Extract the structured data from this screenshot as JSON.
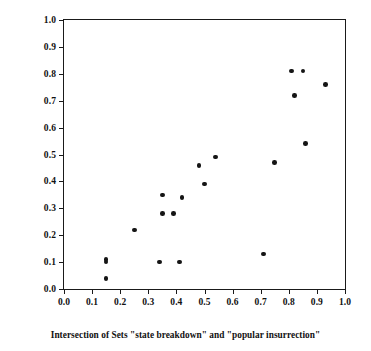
{
  "chart_data": {
    "type": "scatter",
    "title": "",
    "xlabel": "Intersection of Sets \"state breakdown\" and \"popular insurrection\"",
    "ylabel": "Membership in Set of \"social revolutions\"",
    "xlim": [
      0.0,
      1.0
    ],
    "ylim": [
      0.0,
      1.0
    ],
    "grid": false,
    "legend": null,
    "xticks": [
      "0.0",
      "0.1",
      "0.2",
      "0.3",
      "0.4",
      "0.5",
      "0.6",
      "0.7",
      "0.8",
      "0.9",
      "1.0"
    ],
    "xtick_values": [
      0.0,
      0.1,
      0.2,
      0.3,
      0.4,
      0.5,
      0.6,
      0.7,
      0.8,
      0.9,
      1.0
    ],
    "yticks": [
      "0.0",
      "0.1",
      "0.2",
      "0.3",
      "0.4",
      "0.5",
      "0.6",
      "0.7",
      "0.8",
      "0.9",
      "1.0"
    ],
    "ytick_values": [
      0.0,
      0.1,
      0.2,
      0.3,
      0.4,
      0.5,
      0.6,
      0.7,
      0.8,
      0.9,
      1.0
    ],
    "marker": "filled-circle",
    "marker_color": "#151515",
    "marker_size": 4.6,
    "points": [
      {
        "x": 0.15,
        "y": 0.11
      },
      {
        "x": 0.15,
        "y": 0.1
      },
      {
        "x": 0.15,
        "y": 0.04
      },
      {
        "x": 0.25,
        "y": 0.22
      },
      {
        "x": 0.34,
        "y": 0.1
      },
      {
        "x": 0.35,
        "y": 0.35
      },
      {
        "x": 0.35,
        "y": 0.28
      },
      {
        "x": 0.39,
        "y": 0.28
      },
      {
        "x": 0.41,
        "y": 0.1
      },
      {
        "x": 0.42,
        "y": 0.34
      },
      {
        "x": 0.48,
        "y": 0.46
      },
      {
        "x": 0.5,
        "y": 0.39
      },
      {
        "x": 0.54,
        "y": 0.49
      },
      {
        "x": 0.71,
        "y": 0.13
      },
      {
        "x": 0.75,
        "y": 0.47
      },
      {
        "x": 0.81,
        "y": 0.81
      },
      {
        "x": 0.82,
        "y": 0.72
      },
      {
        "x": 0.85,
        "y": 0.81
      },
      {
        "x": 0.86,
        "y": 0.54
      },
      {
        "x": 0.93,
        "y": 0.76
      }
    ]
  },
  "colors": {
    "axis": "#1a1a1a",
    "marker": "#151515",
    "background": "#ffffff",
    "text": "#111111"
  }
}
